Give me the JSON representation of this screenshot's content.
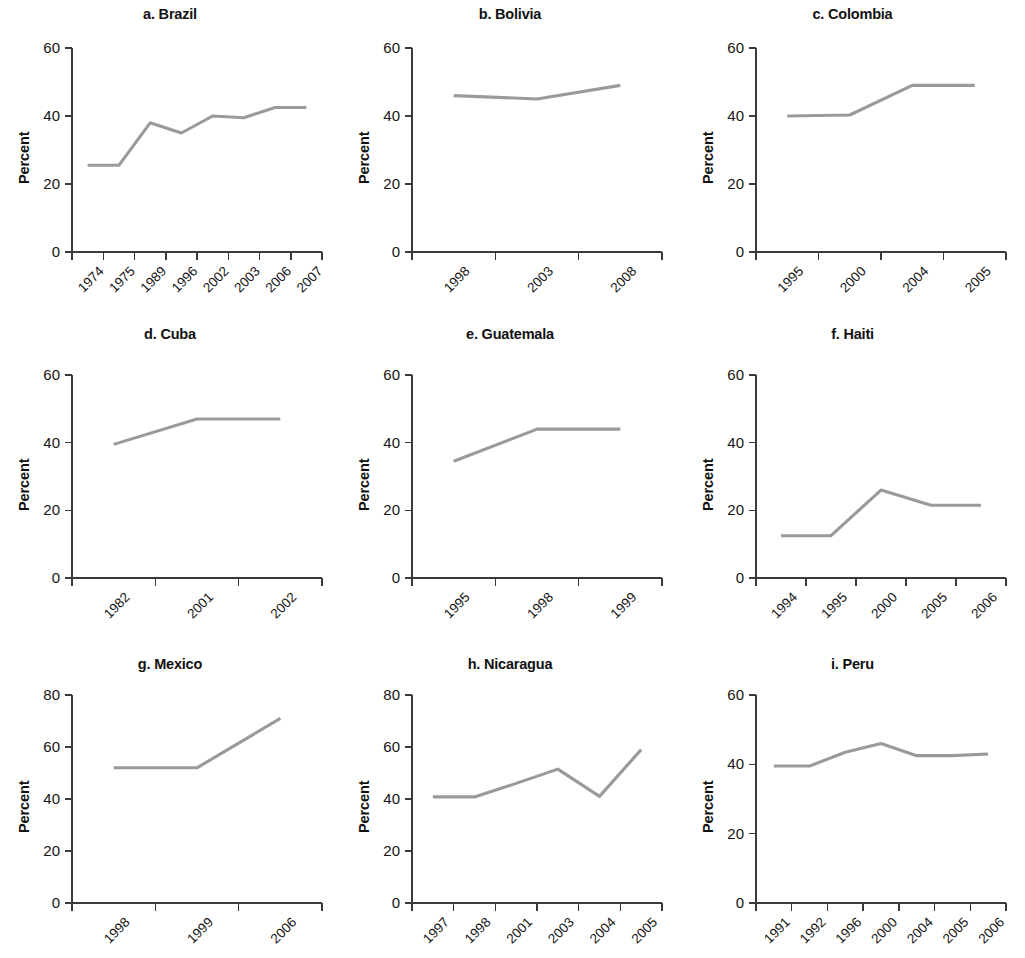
{
  "figure": {
    "background_color": "#ffffff",
    "line_color": "#9a9a9a",
    "axis_color": "#3a3a3a",
    "text_color": "#151515",
    "shared_ylabel": "Percent"
  },
  "chart_data": [
    {
      "type": "line",
      "title": "a. Brazil",
      "xlabel": "",
      "ylabel": "Percent",
      "categories": [
        "1974",
        "1975",
        "1989",
        "1996",
        "2002",
        "2003",
        "2006",
        "2007"
      ],
      "values": [
        25.5,
        25.5,
        38.0,
        35.0,
        40.0,
        39.5,
        42.5,
        42.5
      ],
      "ylim": [
        0,
        60
      ],
      "yticks": [
        0,
        20,
        40,
        60
      ],
      "grid": false,
      "legend": "none"
    },
    {
      "type": "line",
      "title": "b. Bolivia",
      "xlabel": "",
      "ylabel": "Percent",
      "categories": [
        "1998",
        "2003",
        "2008"
      ],
      "values": [
        46.0,
        45.0,
        49.0
      ],
      "ylim": [
        0,
        60
      ],
      "yticks": [
        0,
        20,
        40,
        60
      ],
      "grid": false,
      "legend": "none"
    },
    {
      "type": "line",
      "title": "c. Colombia",
      "xlabel": "",
      "ylabel": "Percent",
      "categories": [
        "1995",
        "2000",
        "2004",
        "2005"
      ],
      "values": [
        40.0,
        40.3,
        49.0,
        49.0
      ],
      "ylim": [
        0,
        60
      ],
      "yticks": [
        0,
        20,
        40,
        60
      ],
      "grid": false,
      "legend": "none"
    },
    {
      "type": "line",
      "title": "d. Cuba",
      "xlabel": "",
      "ylabel": "Percent",
      "categories": [
        "1982",
        "2001",
        "2002"
      ],
      "values": [
        39.5,
        47.0,
        47.0
      ],
      "ylim": [
        0,
        60
      ],
      "yticks": [
        0,
        20,
        40,
        60
      ],
      "grid": false,
      "legend": "none"
    },
    {
      "type": "line",
      "title": "e. Guatemala",
      "xlabel": "",
      "ylabel": "Percent",
      "categories": [
        "1995",
        "1998",
        "1999"
      ],
      "values": [
        34.5,
        44.0,
        44.0
      ],
      "ylim": [
        0,
        60
      ],
      "yticks": [
        0,
        20,
        40,
        60
      ],
      "grid": false,
      "legend": "none"
    },
    {
      "type": "line",
      "title": "f. Haiti",
      "xlabel": "",
      "ylabel": "Percent",
      "categories": [
        "1994",
        "1995",
        "2000",
        "2005",
        "2006"
      ],
      "values": [
        12.5,
        12.5,
        26.0,
        21.5,
        21.5
      ],
      "ylim": [
        0,
        60
      ],
      "yticks": [
        0,
        20,
        40,
        60
      ],
      "grid": false,
      "legend": "none"
    },
    {
      "type": "line",
      "title": "g. Mexico",
      "xlabel": "",
      "ylabel": "Percent",
      "categories": [
        "1998",
        "1999",
        "2006"
      ],
      "values": [
        52.0,
        52.0,
        71.0
      ],
      "ylim": [
        0,
        80
      ],
      "yticks": [
        0,
        20,
        40,
        60,
        80
      ],
      "grid": false,
      "legend": "none"
    },
    {
      "type": "line",
      "title": "h. Nicaragua",
      "xlabel": "",
      "ylabel": "Percent",
      "categories": [
        "1997",
        "1998",
        "2001",
        "2003",
        "2004",
        "2005"
      ],
      "values": [
        40.8,
        40.8,
        46.0,
        51.5,
        41.0,
        59.0
      ],
      "ylim": [
        0,
        80
      ],
      "yticks": [
        0,
        20,
        40,
        60,
        80
      ],
      "grid": false,
      "legend": "none"
    },
    {
      "type": "line",
      "title": "i. Peru",
      "xlabel": "",
      "ylabel": "Percent",
      "categories": [
        "1991",
        "1992",
        "1996",
        "2000",
        "2004",
        "2005",
        "2006"
      ],
      "values": [
        39.5,
        39.5,
        43.5,
        46.0,
        42.5,
        42.5,
        43.0
      ],
      "ylim": [
        0,
        60
      ],
      "yticks": [
        0,
        20,
        40,
        60
      ],
      "grid": false,
      "legend": "none"
    }
  ]
}
